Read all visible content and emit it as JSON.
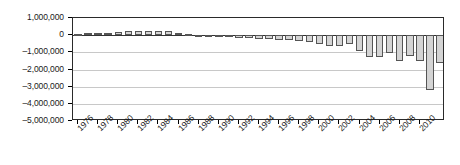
{
  "chart_data": {
    "type": "bar",
    "title": "",
    "xlabel": "",
    "ylabel": "",
    "ylim": [
      -5000000,
      1000000
    ],
    "grid": true,
    "legend": null,
    "y_ticks": [
      {
        "value": 1000000,
        "label": "1,000,000"
      },
      {
        "value": 0,
        "label": "0"
      },
      {
        "value": -1000000,
        "label": "–1,000,000"
      },
      {
        "value": -2000000,
        "label": "–2,000,000"
      },
      {
        "value": -3000000,
        "label": "–3,000,000"
      },
      {
        "value": -4000000,
        "label": "–4,000,000"
      },
      {
        "value": -5000000,
        "label": "–5,000,000"
      }
    ],
    "x_tick_labels": [
      "1976",
      "1978",
      "1980",
      "1982",
      "1984",
      "1986",
      "1988",
      "1990",
      "1992",
      "1994",
      "1996",
      "1998",
      "2000",
      "2002",
      "2004",
      "2006",
      "2008",
      "2010"
    ],
    "categories": [
      "1976",
      "1977",
      "1978",
      "1979",
      "1980",
      "1981",
      "1982",
      "1983",
      "1984",
      "1985",
      "1986",
      "1987",
      "1988",
      "1989",
      "1990",
      "1991",
      "1992",
      "1993",
      "1994",
      "1995",
      "1996",
      "1997",
      "1998",
      "1999",
      "2000",
      "2001",
      "2002",
      "2003",
      "2004",
      "2005",
      "2006",
      "2007",
      "2008",
      "2009",
      "2010",
      "2011",
      "2012"
    ],
    "values": [
      90000,
      100000,
      120000,
      130000,
      210000,
      230000,
      230000,
      230000,
      220000,
      225000,
      150000,
      40000,
      20000,
      10000,
      -20000,
      -90000,
      -150000,
      -180000,
      -240000,
      -230000,
      -260000,
      -300000,
      -330000,
      -420000,
      -490000,
      -620000,
      -620000,
      -500000,
      -930000,
      -1280000,
      -1300000,
      -1060000,
      -1480000,
      -1200000,
      -1500000,
      -3170000,
      -1630000
    ],
    "bar_color": "#d4d4d4",
    "bar_edge_color": "#555555"
  }
}
